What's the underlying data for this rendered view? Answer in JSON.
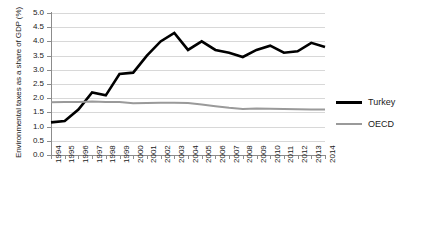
{
  "chart_data": {
    "type": "line",
    "title": "",
    "xlabel": "",
    "ylabel": "Environmental taxes as a share of GDP (%)",
    "x": [
      "1994",
      "1995",
      "1996",
      "1997",
      "1998",
      "1999",
      "2000",
      "2001",
      "2002",
      "2003",
      "2004",
      "2005",
      "2006",
      "2007",
      "2008",
      "2009",
      "2010",
      "2011",
      "2012",
      "2013",
      "2014"
    ],
    "ylim": [
      0.0,
      5.0
    ],
    "ytick_step": 0.5,
    "yticks": [
      "0.0",
      "0.5",
      "1.0",
      "1.5",
      "2.0",
      "2.5",
      "3.0",
      "3.5",
      "4.0",
      "4.5",
      "5.0"
    ],
    "grid": true,
    "legend_position": "right",
    "series": [
      {
        "name": "Turkey",
        "color": "#000000",
        "width": 2.6,
        "values": [
          1.15,
          1.2,
          1.6,
          2.2,
          2.1,
          2.85,
          2.9,
          3.5,
          4.0,
          4.3,
          3.7,
          4.0,
          3.7,
          3.6,
          3.45,
          3.7,
          3.85,
          3.6,
          3.65,
          3.95,
          3.8
        ]
      },
      {
        "name": "OECD",
        "color": "#9a9a9a",
        "width": 2.0,
        "values": [
          1.86,
          1.87,
          1.87,
          1.88,
          1.87,
          1.87,
          1.82,
          1.83,
          1.84,
          1.84,
          1.83,
          1.78,
          1.72,
          1.66,
          1.62,
          1.64,
          1.63,
          1.62,
          1.61,
          1.6,
          1.6
        ]
      }
    ]
  },
  "legend": {
    "items": [
      {
        "label": "Turkey",
        "color": "#000000",
        "thickness": "3px"
      },
      {
        "label": "OECD",
        "color": "#9a9a9a",
        "thickness": "2px"
      }
    ]
  },
  "axes": {
    "y_title": "Environmental taxes as a share of GDP (%)"
  }
}
